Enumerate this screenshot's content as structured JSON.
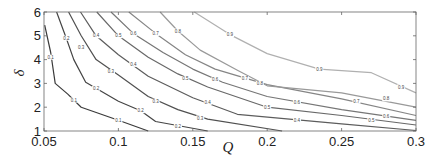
{
  "chart_data": {
    "type": "contour",
    "title": "",
    "xlabel": "Q",
    "ylabel": "δ",
    "xlim": [
      0.05,
      0.3
    ],
    "ylim": [
      1,
      6
    ],
    "grid": false,
    "legend": null,
    "x_ticks": [
      0.05,
      0.1,
      0.15,
      0.2,
      0.25,
      0.3
    ],
    "x_tick_labels": [
      "0.05",
      "0.1",
      "0.15",
      "0.2",
      "0.25",
      "0.3"
    ],
    "y_ticks": [
      1,
      2,
      3,
      4,
      5,
      6
    ],
    "y_tick_labels": [
      "1",
      "2",
      "3",
      "4",
      "5",
      "6"
    ],
    "levels": [
      0.1,
      0.2,
      0.3,
      0.4,
      0.5,
      0.6,
      0.7,
      0.8,
      0.9
    ],
    "contours": [
      {
        "level": 0.1,
        "label": "0.1",
        "color": "#3a3a3a",
        "points": [
          [
            0.0505,
            5.45
          ],
          [
            0.0545,
            4.3
          ],
          [
            0.0575,
            3.0
          ],
          [
            0.066,
            2.55
          ],
          [
            0.075,
            2.0
          ],
          [
            0.1,
            1.45
          ],
          [
            0.12,
            1.0
          ]
        ]
      },
      {
        "level": 0.2,
        "label": "0.2",
        "color": "#444444",
        "points": [
          [
            0.0585,
            6.0
          ],
          [
            0.065,
            4.9
          ],
          [
            0.07,
            4.0
          ],
          [
            0.078,
            3.05
          ],
          [
            0.1,
            2.25
          ],
          [
            0.115,
            1.85
          ],
          [
            0.125,
            1.4
          ],
          [
            0.16,
            1.0
          ]
        ]
      },
      {
        "level": 0.3,
        "label": "0.3",
        "color": "#505050",
        "points": [
          [
            0.0665,
            6.0
          ],
          [
            0.075,
            5.0
          ],
          [
            0.085,
            4.0
          ],
          [
            0.1,
            3.35
          ],
          [
            0.12,
            2.45
          ],
          [
            0.14,
            1.9
          ],
          [
            0.16,
            1.5
          ],
          [
            0.21,
            1.0
          ]
        ]
      },
      {
        "level": 0.4,
        "label": "0.4",
        "color": "#5c5c5c",
        "points": [
          [
            0.0745,
            6.0
          ],
          [
            0.085,
            5.0
          ],
          [
            0.1,
            4.2
          ],
          [
            0.12,
            3.3
          ],
          [
            0.15,
            2.4
          ],
          [
            0.18,
            1.7
          ],
          [
            0.25,
            1.3
          ],
          [
            0.3,
            1.02
          ]
        ]
      },
      {
        "level": 0.5,
        "label": "0.5",
        "color": "#686868",
        "points": [
          [
            0.0855,
            6.0
          ],
          [
            0.1,
            5.0
          ],
          [
            0.12,
            4.1
          ],
          [
            0.14,
            3.4
          ],
          [
            0.16,
            2.85
          ],
          [
            0.2,
            2.0
          ],
          [
            0.25,
            1.65
          ],
          [
            0.3,
            1.25
          ]
        ]
      },
      {
        "level": 0.6,
        "label": "0.6",
        "color": "#767676",
        "points": [
          [
            0.095,
            6.0
          ],
          [
            0.11,
            5.1
          ],
          [
            0.13,
            4.3
          ],
          [
            0.15,
            3.6
          ],
          [
            0.17,
            3.05
          ],
          [
            0.2,
            2.45
          ],
          [
            0.25,
            1.9
          ],
          [
            0.3,
            1.45
          ]
        ]
      },
      {
        "level": 0.7,
        "label": "0.7",
        "color": "#858585",
        "points": [
          [
            0.107,
            6.0
          ],
          [
            0.125,
            5.1
          ],
          [
            0.145,
            4.2
          ],
          [
            0.165,
            3.6
          ],
          [
            0.2,
            2.95
          ],
          [
            0.25,
            2.35
          ],
          [
            0.3,
            1.65
          ]
        ]
      },
      {
        "level": 0.8,
        "label": "0.8",
        "color": "#999999",
        "points": [
          [
            0.128,
            6.0
          ],
          [
            0.14,
            5.2
          ],
          [
            0.155,
            4.4
          ],
          [
            0.18,
            3.55
          ],
          [
            0.2,
            2.9
          ],
          [
            0.25,
            2.6
          ],
          [
            0.3,
            2.0
          ]
        ]
      },
      {
        "level": 0.9,
        "label": "0.9",
        "color": "#b0b0b0",
        "points": [
          [
            0.151,
            6.0
          ],
          [
            0.175,
            5.05
          ],
          [
            0.2,
            4.25
          ],
          [
            0.235,
            3.6
          ],
          [
            0.27,
            3.45
          ],
          [
            0.3,
            2.6
          ]
        ]
      }
    ],
    "label_positions": [
      {
        "level": 0.1,
        "at": [
          [
            0.0545,
            4.1
          ],
          [
            0.07,
            2.3
          ],
          [
            0.1,
            1.45
          ]
        ]
      },
      {
        "level": 0.2,
        "at": [
          [
            0.065,
            4.9
          ],
          [
            0.085,
            2.8
          ],
          [
            0.115,
            1.85
          ],
          [
            0.14,
            1.2
          ]
        ]
      },
      {
        "level": 0.3,
        "at": [
          [
            0.075,
            4.5
          ],
          [
            0.095,
            3.5
          ],
          [
            0.125,
            2.25
          ],
          [
            0.155,
            1.55
          ]
        ]
      },
      {
        "level": 0.4,
        "at": [
          [
            0.085,
            5.0
          ],
          [
            0.11,
            3.8
          ],
          [
            0.16,
            2.2
          ],
          [
            0.22,
            1.45
          ]
        ]
      },
      {
        "level": 0.5,
        "at": [
          [
            0.1,
            5.0
          ],
          [
            0.145,
            3.2
          ],
          [
            0.2,
            2.0
          ],
          [
            0.27,
            1.45
          ]
        ]
      },
      {
        "level": 0.6,
        "at": [
          [
            0.11,
            5.1
          ],
          [
            0.165,
            3.15
          ],
          [
            0.22,
            2.2
          ],
          [
            0.28,
            1.6
          ]
        ]
      },
      {
        "level": 0.7,
        "at": [
          [
            0.125,
            5.1
          ],
          [
            0.185,
            3.2
          ],
          [
            0.26,
            2.25
          ]
        ]
      },
      {
        "level": 0.8,
        "at": [
          [
            0.14,
            5.2
          ],
          [
            0.195,
            3.0
          ],
          [
            0.28,
            2.35
          ]
        ]
      },
      {
        "level": 0.9,
        "at": [
          [
            0.175,
            5.05
          ],
          [
            0.235,
            3.6
          ],
          [
            0.29,
            2.85
          ]
        ]
      }
    ]
  },
  "axes": {
    "x_label": "Q",
    "y_label": "δ"
  }
}
